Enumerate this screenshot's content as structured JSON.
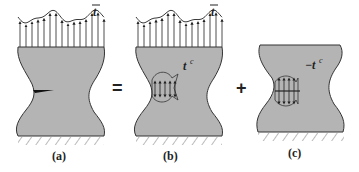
{
  "figure": {
    "panels": [
      {
        "id": "a",
        "label": "(a)",
        "load_label": "t",
        "load_overbar": true,
        "has_crack": true,
        "has_top_traction": true
      },
      {
        "id": "b",
        "label": "(b)",
        "load_label": "t",
        "load_overbar": true,
        "closure_label": "t",
        "closure_sup": "c",
        "has_top_traction": true,
        "closure_sign": ""
      },
      {
        "id": "c",
        "label": "(c)",
        "closure_label": "t",
        "closure_sup": "c",
        "closure_sign": "−",
        "has_top_traction": false
      }
    ],
    "operators": {
      "equals": "=",
      "plus": "+"
    },
    "colors": {
      "body_fill": "#b4b4b4",
      "outline": "#333333",
      "arrow": "#222222"
    }
  }
}
